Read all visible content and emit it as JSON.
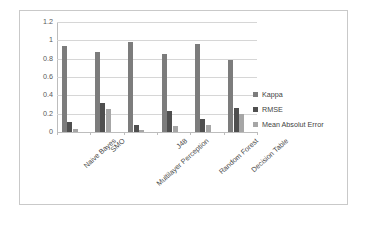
{
  "chart_data": {
    "type": "bar",
    "title": "",
    "xlabel": "",
    "ylabel": "",
    "ylim": [
      0,
      1.2
    ],
    "ytick_values": [
      1.2,
      1,
      0.8,
      0.6,
      0.4,
      0.2,
      0
    ],
    "ytick_labels": [
      "1.2",
      "1",
      "0.8",
      "0.6",
      "0.4",
      "0.2",
      "0"
    ],
    "grid": true,
    "legend_position": "right",
    "categories": [
      "Naive Bayes",
      "SMO",
      "Multilayer Perception",
      "J48",
      "Random Forest",
      "Decision Table"
    ],
    "series": [
      {
        "name": "Kappa",
        "color": "#7c7c7c",
        "values": [
          0.94,
          0.87,
          0.98,
          0.85,
          0.96,
          0.79
        ]
      },
      {
        "name": "RMSE",
        "color": "#4f4f4f",
        "values": [
          0.11,
          0.32,
          0.08,
          0.23,
          0.14,
          0.26
        ]
      },
      {
        "name": "Mean Absolut Error",
        "color": "#a6a6a6",
        "values": [
          0.03,
          0.25,
          0.02,
          0.07,
          0.08,
          0.2
        ]
      }
    ]
  },
  "frame": {
    "border_color": "#c9c9c9",
    "background": "#ffffff"
  }
}
